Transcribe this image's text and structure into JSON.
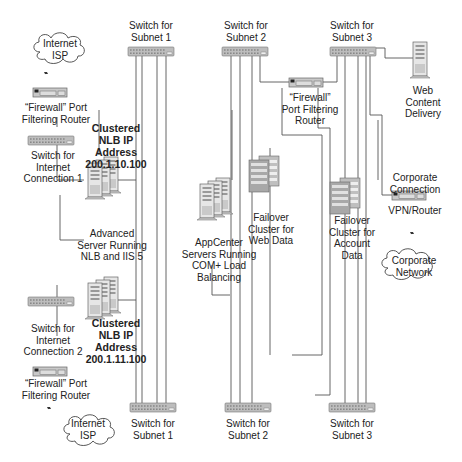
{
  "diagram": {
    "type": "network-topology",
    "colors": {
      "line": "#555555",
      "switch_fill": "#bdbdbd",
      "server_fill": "#d9d9d9",
      "cluster_fill": "#a8a8a8",
      "router_fill": "#c8c8c8",
      "text": "#222222"
    },
    "left": {
      "isp_top": "Internet\nISP",
      "firewall_top": "“Firewall” Port\nFiltering Router",
      "switch_conn1": "Switch for\nInternet\nConnection 1",
      "nlb_ip_top": "Clustered\nNLB IP\nAddress\n200.1.10.100",
      "nlb_servers": "Advanced\nServer Running\nNLB and IIS 5",
      "switch_conn2": "Switch for\nInternet\nConnection 2",
      "nlb_ip_bottom": "Clustered\nNLB IP\nAddress\n200.1.11.100",
      "firewall_bottom": "“Firewall” Port\nFiltering Router",
      "isp_bottom": "Internet\nISP"
    },
    "subnets": {
      "top": [
        {
          "label": "Switch for\nSubnet 1"
        },
        {
          "label": "Switch for\nSubnet 2"
        },
        {
          "label": "Switch for\nSubnet 3"
        }
      ],
      "bottom": [
        {
          "label": "Switch for\nSubnet 1"
        },
        {
          "label": "Switch for\nSubnet 2"
        },
        {
          "label": "Switch for\nSubnet 3"
        }
      ]
    },
    "middle": {
      "appcenter": "AppCenter\nServers Running\nCOM+ Load\nBalancing",
      "web_cluster": "Failover\nCluster for\nWeb Data",
      "internal_firewall": "“Firewall”\nPort Filtering\nRouter",
      "account_cluster": "Failover\nCluster for\nAccount\nData"
    },
    "right": {
      "web_content": "Web\nContent\nDelivery",
      "corp_connection": "Corporate\nConnection",
      "vpn_router": "VPN/Router",
      "corp_network": "Corporate\nNetwork"
    }
  }
}
